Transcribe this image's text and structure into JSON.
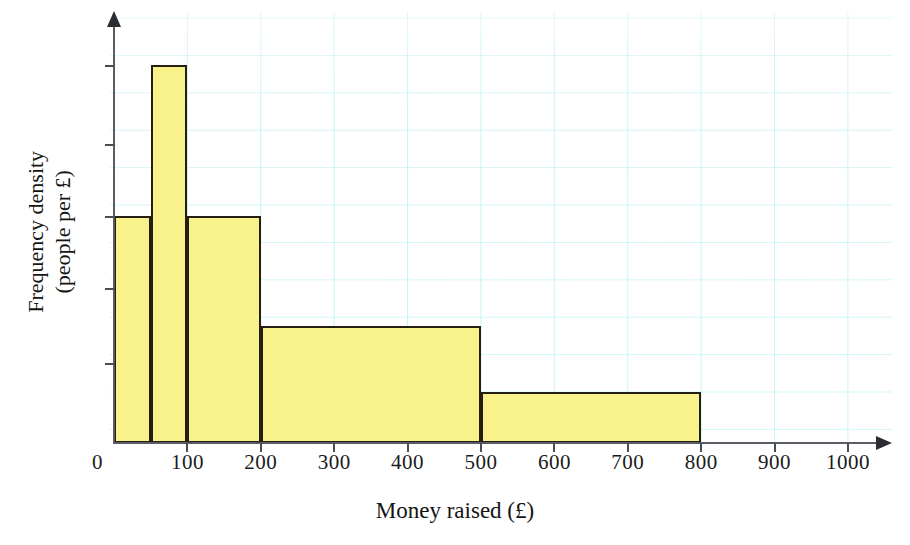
{
  "chart_data": {
    "type": "bar",
    "title": "",
    "subtitle": "",
    "xlabel": "Money raised (£)",
    "ylabel_line1": "Frequency density",
    "ylabel_line2": "(people per £)",
    "x_tick_labels": [
      "0",
      "100",
      "200",
      "300",
      "400",
      "500",
      "600",
      "700",
      "800",
      "900",
      "1000"
    ],
    "x_tick_values": [
      0,
      100,
      200,
      300,
      400,
      500,
      600,
      700,
      800,
      900,
      1000
    ],
    "y_tick_labels": [
      "",
      "",
      "",
      "",
      ""
    ],
    "xlim": [
      0,
      1010
    ],
    "ylim": [
      0,
      5.7
    ],
    "grid": true,
    "grid_color": "#78e1e6",
    "legend": "none",
    "bar_fill": "#f9f28a",
    "bar_edge": "#241f12",
    "bins": [
      {
        "label": "0-50",
        "start": 0,
        "end": 50,
        "frequency_density": 3.0
      },
      {
        "label": "50-100",
        "start": 50,
        "end": 100,
        "frequency_density": 5.0
      },
      {
        "label": "100-200",
        "start": 100,
        "end": 200,
        "frequency_density": 3.0
      },
      {
        "label": "200-500",
        "start": 200,
        "end": 500,
        "frequency_density": 1.55
      },
      {
        "label": "500-800",
        "start": 500,
        "end": 800,
        "frequency_density": 0.68
      }
    ]
  },
  "axis": {
    "y_ticks_px": [
      65,
      144,
      216,
      288,
      363
    ],
    "origin_px": {
      "x": 114,
      "y": 443
    },
    "px_per_unit_x": 0.734
  }
}
